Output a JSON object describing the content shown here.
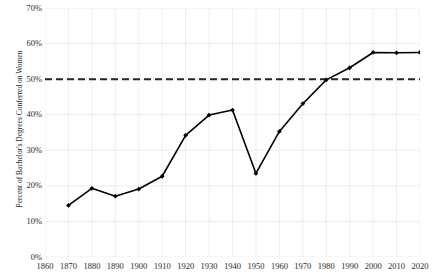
{
  "chart_data": {
    "type": "line",
    "title": "",
    "xlabel": "",
    "ylabel": "Percent of Bachelor's Degrees Conferred on Women",
    "xlim": [
      1860,
      2020
    ],
    "ylim": [
      0,
      70
    ],
    "grid": true,
    "legend": "none",
    "x_ticks": [
      1860,
      1870,
      1880,
      1890,
      1900,
      1910,
      1920,
      1930,
      1940,
      1950,
      1960,
      1970,
      1980,
      1990,
      2000,
      2010,
      2020
    ],
    "x_tick_labels": [
      "1860",
      "1870",
      "1880",
      "1890",
      "1900",
      "1910",
      "1920",
      "1930",
      "1940",
      "1950",
      "1960",
      "1970",
      "1980",
      "1990",
      "2000",
      "2010",
      "2020"
    ],
    "y_ticks": [
      0,
      10,
      20,
      30,
      40,
      50,
      60,
      70
    ],
    "y_tick_labels": [
      "0%",
      "10%",
      "20%",
      "30%",
      "40%",
      "50%",
      "60%",
      "70%"
    ],
    "x": [
      1870,
      1880,
      1890,
      1900,
      1910,
      1920,
      1930,
      1940,
      1950,
      1960,
      1970,
      1980,
      1990,
      2000,
      2010,
      2020
    ],
    "values": [
      14.5,
      19.3,
      17.1,
      19.1,
      22.7,
      34.2,
      39.9,
      41.3,
      23.5,
      35.3,
      43.1,
      49.8,
      53.2,
      57.5,
      57.4,
      57.5
    ],
    "series": [
      {
        "name": "Percent of Bachelor's Degrees Conferred on Women",
        "color": "#000000",
        "marker": "diamond",
        "values": [
          14.5,
          19.3,
          17.1,
          19.1,
          22.7,
          34.2,
          39.9,
          41.3,
          23.5,
          35.3,
          43.1,
          49.8,
          53.2,
          57.5,
          57.4,
          57.5
        ]
      }
    ],
    "reference_line": {
      "name": "parity-50-percent",
      "y": 50,
      "style": "dashed",
      "color": "#262626",
      "label": ""
    },
    "colors": {
      "line": "#000000",
      "marker": "#000000",
      "reference_line": "#262626",
      "grid": "#ededed",
      "axis_text": "#2b2b2b",
      "background": "#ffffff"
    }
  }
}
